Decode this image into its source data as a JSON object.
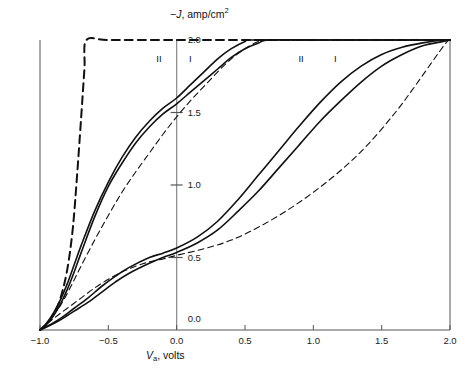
{
  "figure": {
    "y_axis_label_prefix": "−",
    "y_axis_label_symbol": "J",
    "y_axis_label_rest": ", amp/cm",
    "y_axis_label_exponent": "2",
    "x_axis_label_symbol": "V",
    "x_axis_label_subscript": "a",
    "x_axis_label_rest": ", volts"
  },
  "chart_data": {
    "type": "line",
    "title": "",
    "xlabel": "V_a, volts",
    "ylabel": "−J, amp/cm^2",
    "xlim": [
      -1.0,
      2.0
    ],
    "ylim": [
      0.0,
      2.0
    ],
    "xticks": [
      -1.0,
      -0.5,
      0.0,
      0.5,
      1.0,
      1.5,
      2.0
    ],
    "xtick_labels": [
      "−1.0",
      "−0.5",
      "0.0",
      "0.5",
      "1.0",
      "1.5",
      "2.0"
    ],
    "yticks": [
      0.0,
      0.5,
      1.0,
      1.5,
      2.0
    ],
    "ytick_labels": [
      "0.0",
      "0.5",
      "1.0",
      "1.5",
      "2.0"
    ],
    "grid": false,
    "legend": "inline-curve-labels",
    "annotations": [
      {
        "text": "II",
        "x": -0.12,
        "y": 1.87,
        "group": "left"
      },
      {
        "text": "I",
        "x": 0.12,
        "y": 1.87,
        "group": "left"
      },
      {
        "text": "II",
        "x": 0.92,
        "y": 1.87,
        "group": "right"
      },
      {
        "text": "I",
        "x": 1.18,
        "y": 1.87,
        "group": "right"
      }
    ],
    "series": [
      {
        "name": "left-bold-dashed",
        "style": "dashed",
        "width": 2.0,
        "points": [
          [
            -1.0,
            0.0
          ],
          [
            -0.95,
            0.04
          ],
          [
            -0.9,
            0.11
          ],
          [
            -0.85,
            0.22
          ],
          [
            -0.8,
            0.42
          ],
          [
            -0.76,
            0.7
          ],
          [
            -0.73,
            1.05
          ],
          [
            -0.7,
            1.45
          ],
          [
            -0.675,
            1.8
          ],
          [
            -0.66,
            2.0
          ],
          [
            -0.5,
            2.0
          ],
          [
            0.0,
            2.0
          ],
          [
            0.5,
            2.0
          ],
          [
            1.0,
            2.0
          ],
          [
            1.5,
            2.0
          ],
          [
            2.0,
            2.0
          ]
        ]
      },
      {
        "name": "left-curve-II",
        "style": "solid",
        "width": 1.6,
        "points": [
          [
            -1.0,
            0.0
          ],
          [
            -0.95,
            0.05
          ],
          [
            -0.9,
            0.12
          ],
          [
            -0.85,
            0.21
          ],
          [
            -0.8,
            0.32
          ],
          [
            -0.75,
            0.45
          ],
          [
            -0.7,
            0.58
          ],
          [
            -0.6,
            0.82
          ],
          [
            -0.5,
            1.02
          ],
          [
            -0.4,
            1.19
          ],
          [
            -0.3,
            1.33
          ],
          [
            -0.2,
            1.44
          ],
          [
            -0.1,
            1.53
          ],
          [
            0.0,
            1.6
          ],
          [
            0.1,
            1.69
          ],
          [
            0.2,
            1.78
          ],
          [
            0.3,
            1.87
          ],
          [
            0.4,
            1.94
          ],
          [
            0.5,
            1.99
          ],
          [
            0.55,
            2.0
          ],
          [
            1.0,
            2.0
          ],
          [
            1.5,
            2.0
          ],
          [
            2.0,
            2.0
          ]
        ]
      },
      {
        "name": "left-curve-I",
        "style": "solid",
        "width": 1.6,
        "points": [
          [
            -1.0,
            0.0
          ],
          [
            -0.95,
            0.04
          ],
          [
            -0.9,
            0.1
          ],
          [
            -0.85,
            0.18
          ],
          [
            -0.8,
            0.28
          ],
          [
            -0.75,
            0.4
          ],
          [
            -0.7,
            0.53
          ],
          [
            -0.6,
            0.78
          ],
          [
            -0.5,
            0.99
          ],
          [
            -0.4,
            1.15
          ],
          [
            -0.3,
            1.29
          ],
          [
            -0.2,
            1.4
          ],
          [
            -0.1,
            1.49
          ],
          [
            0.0,
            1.56
          ],
          [
            0.1,
            1.64
          ],
          [
            0.2,
            1.72
          ],
          [
            0.3,
            1.8
          ],
          [
            0.4,
            1.88
          ],
          [
            0.5,
            1.94
          ],
          [
            0.6,
            1.98
          ],
          [
            0.68,
            2.0
          ],
          [
            1.0,
            2.0
          ],
          [
            1.5,
            2.0
          ],
          [
            2.0,
            2.0
          ]
        ]
      },
      {
        "name": "left-thin-dashed",
        "style": "dashed",
        "width": 1.1,
        "points": [
          [
            -1.0,
            0.0
          ],
          [
            -0.93,
            0.07
          ],
          [
            -0.85,
            0.17
          ],
          [
            -0.78,
            0.29
          ],
          [
            -0.7,
            0.44
          ],
          [
            -0.6,
            0.62
          ],
          [
            -0.5,
            0.79
          ],
          [
            -0.4,
            0.95
          ],
          [
            -0.3,
            1.09
          ],
          [
            -0.2,
            1.22
          ],
          [
            -0.1,
            1.35
          ],
          [
            0.0,
            1.47
          ],
          [
            0.1,
            1.58
          ],
          [
            0.2,
            1.68
          ],
          [
            0.3,
            1.78
          ],
          [
            0.4,
            1.87
          ],
          [
            0.5,
            1.94
          ],
          [
            0.6,
            1.99
          ],
          [
            0.66,
            2.0
          ],
          [
            1.0,
            2.0
          ],
          [
            1.5,
            2.0
          ],
          [
            2.0,
            2.0
          ]
        ]
      },
      {
        "name": "right-curve-II",
        "style": "solid",
        "width": 1.6,
        "points": [
          [
            -1.0,
            0.0
          ],
          [
            -0.93,
            0.035
          ],
          [
            -0.85,
            0.08
          ],
          [
            -0.75,
            0.15
          ],
          [
            -0.65,
            0.22
          ],
          [
            -0.55,
            0.3
          ],
          [
            -0.45,
            0.37
          ],
          [
            -0.35,
            0.43
          ],
          [
            -0.2,
            0.5
          ],
          [
            -0.1,
            0.53
          ],
          [
            0.0,
            0.565
          ],
          [
            0.15,
            0.64
          ],
          [
            0.3,
            0.75
          ],
          [
            0.45,
            0.9
          ],
          [
            0.6,
            1.07
          ],
          [
            0.75,
            1.24
          ],
          [
            0.9,
            1.41
          ],
          [
            1.05,
            1.57
          ],
          [
            1.2,
            1.71
          ],
          [
            1.35,
            1.82
          ],
          [
            1.5,
            1.9
          ],
          [
            1.65,
            1.95
          ],
          [
            1.8,
            1.98
          ],
          [
            1.95,
            2.0
          ],
          [
            2.0,
            2.0
          ]
        ]
      },
      {
        "name": "right-curve-I",
        "style": "solid",
        "width": 1.6,
        "points": [
          [
            -1.0,
            0.0
          ],
          [
            -0.93,
            0.03
          ],
          [
            -0.85,
            0.07
          ],
          [
            -0.75,
            0.13
          ],
          [
            -0.65,
            0.19
          ],
          [
            -0.55,
            0.26
          ],
          [
            -0.45,
            0.33
          ],
          [
            -0.35,
            0.39
          ],
          [
            -0.2,
            0.46
          ],
          [
            -0.1,
            0.5
          ],
          [
            0.0,
            0.535
          ],
          [
            0.15,
            0.6
          ],
          [
            0.3,
            0.69
          ],
          [
            0.45,
            0.82
          ],
          [
            0.6,
            0.96
          ],
          [
            0.75,
            1.12
          ],
          [
            0.9,
            1.28
          ],
          [
            1.05,
            1.44
          ],
          [
            1.2,
            1.58
          ],
          [
            1.35,
            1.71
          ],
          [
            1.5,
            1.82
          ],
          [
            1.65,
            1.9
          ],
          [
            1.8,
            1.96
          ],
          [
            1.95,
            1.99
          ],
          [
            2.0,
            2.0
          ]
        ]
      },
      {
        "name": "right-thin-dashed",
        "style": "dashed",
        "width": 1.1,
        "points": [
          [
            -1.0,
            0.0
          ],
          [
            -0.9,
            0.08
          ],
          [
            -0.8,
            0.15
          ],
          [
            -0.7,
            0.22
          ],
          [
            -0.6,
            0.29
          ],
          [
            -0.5,
            0.35
          ],
          [
            -0.4,
            0.4
          ],
          [
            -0.3,
            0.44
          ],
          [
            -0.2,
            0.47
          ],
          [
            -0.1,
            0.49
          ],
          [
            0.0,
            0.515
          ],
          [
            0.2,
            0.56
          ],
          [
            0.4,
            0.62
          ],
          [
            0.6,
            0.71
          ],
          [
            0.8,
            0.82
          ],
          [
            1.0,
            0.95
          ],
          [
            1.2,
            1.1
          ],
          [
            1.4,
            1.28
          ],
          [
            1.6,
            1.5
          ],
          [
            1.75,
            1.69
          ],
          [
            1.9,
            1.89
          ],
          [
            1.98,
            1.99
          ],
          [
            2.0,
            2.0
          ]
        ]
      }
    ]
  }
}
